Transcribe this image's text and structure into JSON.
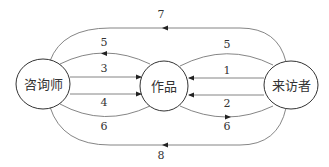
{
  "diagram": {
    "type": "flow",
    "nodes": [
      {
        "id": "counselor",
        "label": "咨询师",
        "cx": 43,
        "cy": 84,
        "rx": 27,
        "ry": 25
      },
      {
        "id": "artwork",
        "label": "作品",
        "cx": 164,
        "cy": 86,
        "rx": 24,
        "ry": 25
      },
      {
        "id": "visitor",
        "label": "来访者",
        "cx": 291,
        "cy": 85,
        "rx": 27,
        "ry": 24
      }
    ],
    "edges": [
      {
        "label": "7",
        "from": "visitor",
        "to": "counselor",
        "shape": "outer-top-arc"
      },
      {
        "label": "5",
        "from": "artwork",
        "to": "counselor",
        "shape": "upper-arc-left"
      },
      {
        "label": "3",
        "from": "counselor",
        "to": "artwork",
        "shape": "straight-upper-left"
      },
      {
        "label": "4",
        "from": "counselor",
        "to": "artwork",
        "shape": "straight-lower-left"
      },
      {
        "label": "6",
        "from": "counselor",
        "to": "artwork",
        "shape": "lower-arc-left"
      },
      {
        "label": "5",
        "from": "visitor",
        "to": "artwork",
        "shape": "upper-arc-right"
      },
      {
        "label": "1",
        "from": "visitor",
        "to": "artwork",
        "shape": "straight-upper-right"
      },
      {
        "label": "2",
        "from": "visitor",
        "to": "artwork",
        "shape": "straight-lower-right"
      },
      {
        "label": "6",
        "from": "artwork",
        "to": "visitor",
        "shape": "lower-arc-right"
      },
      {
        "label": "8",
        "from": "visitor",
        "to": "counselor",
        "shape": "outer-bottom-arc"
      }
    ]
  },
  "labels": {
    "node_counselor": "咨询师",
    "node_artwork": "作品",
    "node_visitor": "来访者",
    "edge_7": "7",
    "edge_5_left": "5",
    "edge_3": "3",
    "edge_4": "4",
    "edge_6_left": "6",
    "edge_5_right": "5",
    "edge_1": "1",
    "edge_2": "2",
    "edge_6_right": "6",
    "edge_8": "8"
  },
  "colors": {
    "line": "#777777",
    "node_stroke": "#333333",
    "text": "#333333",
    "background": "#ffffff"
  }
}
